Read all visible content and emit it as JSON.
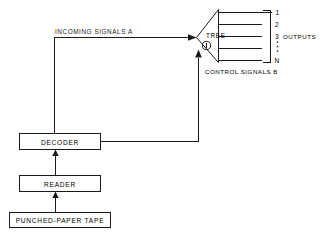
{
  "diagram": {
    "colors": {
      "ink": "#1a1a1a",
      "background": "#ffffff"
    },
    "labels": {
      "incoming_signals": "INCOMING  SIGNALS  A",
      "control_signals": "CONTROL SIGNALS  B",
      "tree": "TREE",
      "tree_marker": "1",
      "outputs": "OUTPUTS"
    },
    "output_numbers": {
      "first": "1",
      "second": "2",
      "third": "3",
      "last": "N",
      "ellipsis": "⋮"
    },
    "boxes": [
      {
        "id": "decoder",
        "label": "DECODER"
      },
      {
        "id": "reader",
        "label": "READER"
      },
      {
        "id": "tape",
        "label": "PUNCHED-PAPER TAPE"
      }
    ],
    "output_count": 5
  }
}
